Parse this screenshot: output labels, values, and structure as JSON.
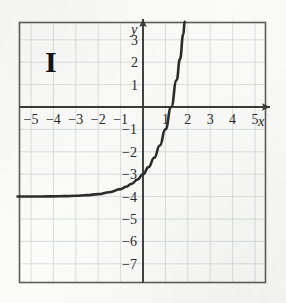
{
  "figure": {
    "label": "I",
    "axis_labels": {
      "x": "x",
      "y": "y"
    }
  },
  "chart_data": {
    "type": "line",
    "title": "",
    "subtitle": "",
    "xlabel": "x",
    "ylabel": "y",
    "xlim": [
      -5.6,
      5.7
    ],
    "ylim": [
      -7.8,
      3.8
    ],
    "grid": true,
    "grid_step": 1,
    "legend": null,
    "annotations": [
      "I"
    ],
    "xticks": [
      -5,
      -4,
      -3,
      -2,
      -1,
      1,
      2,
      3,
      4,
      5
    ],
    "xtick_labels": [
      "−5",
      "−4",
      "−3",
      "−2",
      "−1",
      "1",
      "2",
      "3",
      "4",
      "5"
    ],
    "yticks": [
      3,
      2,
      1,
      -1,
      -2,
      -3,
      -4,
      -5,
      -6,
      -7
    ],
    "ytick_labels": [
      "3",
      "2",
      "1",
      "−1",
      "−2",
      "−3",
      "−4",
      "−5",
      "−6",
      "−7"
    ],
    "series": [
      {
        "name": "exponential",
        "equation": "y = 3^x − 4",
        "asymptote": -4,
        "y_intercept": -3,
        "x_intercept": 1.26,
        "points": [
          {
            "x": -5.6,
            "y": -3.996
          },
          {
            "x": -5.0,
            "y": -3.996
          },
          {
            "x": -4.5,
            "y": -3.993
          },
          {
            "x": -4.0,
            "y": -3.988
          },
          {
            "x": -3.5,
            "y": -3.979
          },
          {
            "x": -3.0,
            "y": -3.963
          },
          {
            "x": -2.5,
            "y": -3.936
          },
          {
            "x": -2.0,
            "y": -3.889
          },
          {
            "x": -1.5,
            "y": -3.808
          },
          {
            "x": -1.0,
            "y": -3.667
          },
          {
            "x": -0.75,
            "y": -3.561
          },
          {
            "x": -0.5,
            "y": -3.423
          },
          {
            "x": -0.25,
            "y": -3.24
          },
          {
            "x": 0.0,
            "y": -3.0
          },
          {
            "x": 0.25,
            "y": -2.684
          },
          {
            "x": 0.5,
            "y": -2.268
          },
          {
            "x": 0.75,
            "y": -1.721
          },
          {
            "x": 1.0,
            "y": -1.0
          },
          {
            "x": 1.26,
            "y": 0.0
          },
          {
            "x": 1.5,
            "y": 1.196
          },
          {
            "x": 1.65,
            "y": 2.136
          },
          {
            "x": 1.8,
            "y": 3.247
          },
          {
            "x": 1.86,
            "y": 3.8
          }
        ]
      }
    ]
  },
  "colors": {
    "paper": "#fbfbfa",
    "grid": "#d6d9dd",
    "frame": "#5d5d5d",
    "axis": "#3a3a3a",
    "curve": "#2b2b2b",
    "tick_text": "#2a2a2a"
  }
}
